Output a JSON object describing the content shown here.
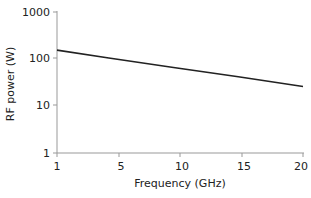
{
  "chart_data": {
    "type": "line",
    "title": "",
    "xlabel": "Frequency (GHz)",
    "ylabel": "RF power (W)",
    "xlim": [
      1,
      20
    ],
    "ylim": [
      1,
      1000
    ],
    "yscale": "log",
    "grid": false,
    "x_ticks": [
      "1",
      "5",
      "10",
      "15",
      "20"
    ],
    "y_ticks": [
      "1",
      "10",
      "100",
      "1000"
    ],
    "series": [
      {
        "name": "RF power",
        "x": [
          1,
          5,
          10,
          15,
          20
        ],
        "values": [
          155,
          105,
          66,
          42,
          26
        ]
      }
    ]
  }
}
